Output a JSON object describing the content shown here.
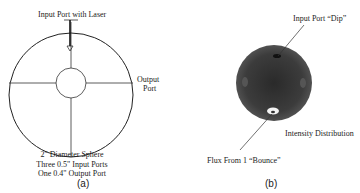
{
  "panel_a": {
    "input_label": "Input Port with Laser",
    "output_label_line1": "Output",
    "output_label_line2": "Port",
    "spec_lines": [
      "2\" Diameter Sphere",
      "Three 0.5\" Input Ports",
      "One 0.4\" Output Port"
    ],
    "caption": "(a)"
  },
  "panel_b": {
    "dip_label": "Input Port “Dip”",
    "intensity_label": "Intensity Distribution",
    "bounce_label": "Flux From 1 “Bounce”",
    "caption": "(b)"
  }
}
